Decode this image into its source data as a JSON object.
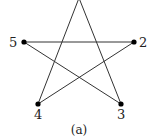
{
  "figure": {
    "caption": "(a)",
    "vertices": [
      {
        "id": "1",
        "label": "",
        "x": 79,
        "y": -2,
        "dot": false
      },
      {
        "id": "2",
        "label": "2",
        "x": 134,
        "y": 42,
        "dot": true
      },
      {
        "id": "3",
        "label": "3",
        "x": 121,
        "y": 104,
        "dot": true
      },
      {
        "id": "4",
        "label": "4",
        "x": 38,
        "y": 104,
        "dot": true
      },
      {
        "id": "5",
        "label": "5",
        "x": 24,
        "y": 42,
        "dot": true
      }
    ],
    "edges": [
      [
        "1",
        "4"
      ],
      [
        "1",
        "3"
      ],
      [
        "5",
        "2"
      ],
      [
        "5",
        "3"
      ],
      [
        "2",
        "4"
      ]
    ],
    "line_color": "#333333",
    "dot_color": "#000000"
  }
}
